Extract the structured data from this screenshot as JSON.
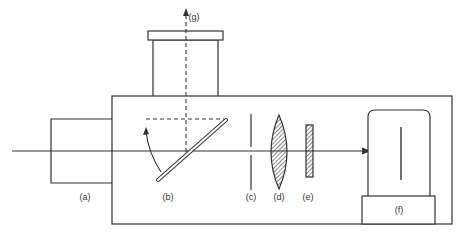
{
  "diagram": {
    "type": "optical-instrument-schematic",
    "stroke_color": "#333333",
    "background": "#ffffff",
    "labels": {
      "a": "(a)",
      "b": "(b)",
      "c": "(c)",
      "d": "(d)",
      "e": "(e)",
      "f": "(f)",
      "g": "(g)"
    },
    "components": [
      {
        "id": "a",
        "name": "entrance tube"
      },
      {
        "id": "b",
        "name": "pivoting mirror"
      },
      {
        "id": "c",
        "name": "aperture"
      },
      {
        "id": "d",
        "name": "lens"
      },
      {
        "id": "e",
        "name": "filter"
      },
      {
        "id": "f",
        "name": "detector"
      },
      {
        "id": "g",
        "name": "viewing output"
      }
    ]
  }
}
